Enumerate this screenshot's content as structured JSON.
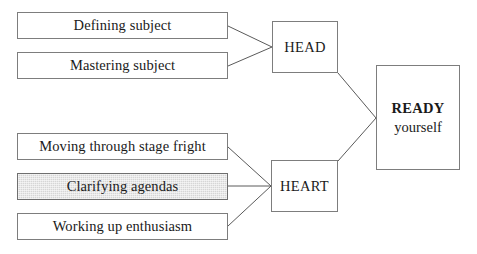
{
  "diagram": {
    "background_color": "#ffffff",
    "line_color": "#5a5a5a",
    "box_border_color": "#7d7d7d",
    "shaded_fill_color": "#d6d6d6",
    "head_group": {
      "inputs": [
        {
          "label": "Defining subject",
          "shaded": false
        },
        {
          "label": "Mastering subject",
          "shaded": false
        }
      ],
      "hub": {
        "label": "HEAD"
      }
    },
    "heart_group": {
      "inputs": [
        {
          "label": "Moving through stage fright",
          "shaded": false
        },
        {
          "label": "Clarifying agendas",
          "shaded": true
        },
        {
          "label": "Working up enthusiasm",
          "shaded": false
        }
      ],
      "hub": {
        "label": "HEART"
      }
    },
    "outcome": {
      "title": "READY",
      "subtitle": "yourself"
    }
  }
}
